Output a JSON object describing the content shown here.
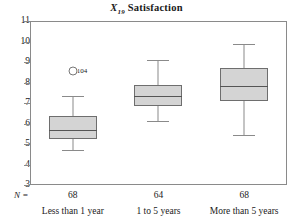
{
  "chart_data": {
    "type": "box",
    "title": "X19 Satisfaction",
    "title_variable": "X",
    "title_subscript": "19",
    "title_text": "Satisfaction",
    "xlabel": "",
    "ylabel": "",
    "ylim": [
      3,
      11
    ],
    "yticks": [
      11,
      10,
      9,
      8,
      7,
      6,
      5,
      4,
      3
    ],
    "grid": false,
    "legend": "none",
    "n_prefix": "N =",
    "categories": [
      "Less than 1 year",
      "1 to 5 years",
      "More than 5 years"
    ],
    "counts": [
      68,
      64,
      68
    ],
    "boxes": [
      {
        "category": "Less than 1 year",
        "n": 68,
        "whisker_low": 4.7,
        "q1": 5.25,
        "median": 5.7,
        "q3": 6.35,
        "whisker_high": 7.35,
        "outliers": [
          {
            "value": 8.55,
            "label": "104"
          }
        ]
      },
      {
        "category": "1 to 5 years",
        "n": 64,
        "whisker_low": 6.1,
        "q1": 6.85,
        "median": 7.35,
        "q3": 7.9,
        "whisker_high": 9.1,
        "outliers": []
      },
      {
        "category": "More than 5 years",
        "n": 68,
        "whisker_low": 5.45,
        "q1": 7.1,
        "median": 7.85,
        "q3": 8.7,
        "whisker_high": 9.9,
        "outliers": []
      }
    ],
    "colors": {
      "box_fill": "#d4d4d4",
      "box_border": "#6e6e6e",
      "median": "#555555",
      "whisker": "#8a8a8a",
      "frame": "#8a8a8a",
      "background": "#ffffff",
      "text": "#1a1a1a"
    }
  }
}
